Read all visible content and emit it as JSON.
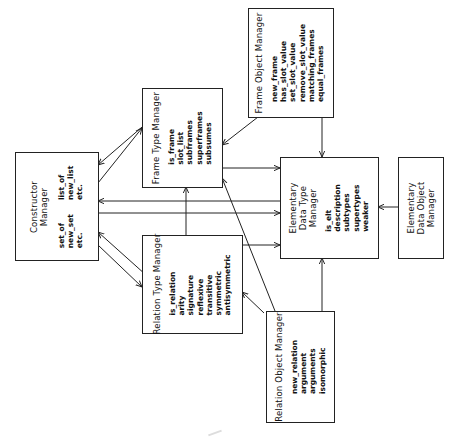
{
  "diagram": {
    "orientation": "rotated -90deg",
    "boxes": {
      "constructor": {
        "title_lines": [
          "Constructor",
          "Manager"
        ],
        "col1": [
          "set_of",
          "new_set",
          "etc."
        ],
        "col2": [
          "list_of",
          "new_list",
          "etc."
        ]
      },
      "frame_type": {
        "title": "Frame Type Manager",
        "ops": [
          "is_frame",
          "slot_list",
          "subframes",
          "superframes",
          "subsumes"
        ]
      },
      "frame_object": {
        "title": "Frame Object Manager",
        "ops": [
          "new_frame",
          "has_slot_value",
          "set_slot_value",
          "remove_slot_value",
          "matching_frames",
          "equal_frames"
        ]
      },
      "elementary_type": {
        "title_lines": [
          "Elementary",
          "Data Type",
          "Manager"
        ],
        "ops": [
          "is_elt",
          "description",
          "subtypes",
          "supertypes",
          "weaker"
        ]
      },
      "elementary_object": {
        "title_lines": [
          "Elementary",
          "Data Object",
          "Manager"
        ]
      },
      "relation_type": {
        "title": "Relation Type Manager",
        "ops": [
          "is_relation",
          "arity",
          "signature",
          "reflexive",
          "transitive",
          "symmetric",
          "antisymmetric"
        ]
      },
      "relation_object": {
        "title": "Relation Object Manager",
        "ops": [
          "new_relation",
          "argument",
          "arguments",
          "isomorphic"
        ]
      }
    },
    "edges": [
      {
        "from": "frame_type",
        "to": "constructor"
      },
      {
        "from": "constructor",
        "to": "frame_type"
      },
      {
        "from": "elementary_type",
        "to": "constructor"
      },
      {
        "from": "constructor",
        "to": "elementary_type"
      },
      {
        "from": "relation_type",
        "to": "constructor"
      },
      {
        "from": "constructor",
        "to": "relation_type"
      },
      {
        "from": "frame_object",
        "to": "frame_type"
      },
      {
        "from": "frame_object",
        "to": "elementary_type"
      },
      {
        "from": "frame_type",
        "to": "elementary_type"
      },
      {
        "from": "relation_type",
        "to": "frame_type"
      },
      {
        "from": "relation_type",
        "to": "elementary_type"
      },
      {
        "from": "relation_object",
        "to": "frame_type"
      },
      {
        "from": "relation_object",
        "to": "relation_type"
      },
      {
        "from": "relation_object",
        "to": "elementary_type"
      },
      {
        "from": "elementary_object",
        "to": "elementary_type"
      }
    ],
    "colors": {
      "line": "#222222",
      "background": "#ffffff"
    }
  }
}
